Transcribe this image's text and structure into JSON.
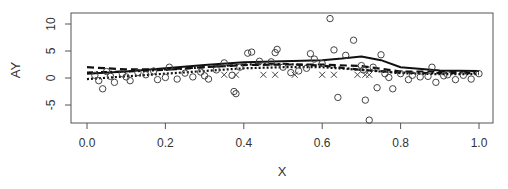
{
  "chart_data": {
    "type": "scatter",
    "title": "",
    "xlabel": "X",
    "ylabel": "AY",
    "xlim": [
      -0.04,
      1.04
    ],
    "ylim": [
      -8.5,
      12
    ],
    "xticks": [
      0.0,
      0.2,
      0.4,
      0.6,
      0.8,
      1.0
    ],
    "xtick_labels": [
      "0.0",
      "0.2",
      "0.4",
      "0.6",
      "0.8",
      "1.0"
    ],
    "yticks": [
      -5,
      0,
      5,
      10
    ],
    "ytick_labels": [
      "-5",
      "0",
      "5",
      "10"
    ],
    "grid": false,
    "legend": null,
    "series": [
      {
        "name": "observed (circles)",
        "marker": "circle",
        "points": [
          [
            0.02,
            0.5
          ],
          [
            0.03,
            -0.5
          ],
          [
            0.04,
            -2.0
          ],
          [
            0.05,
            1.2
          ],
          [
            0.06,
            0.3
          ],
          [
            0.07,
            -0.8
          ],
          [
            0.09,
            0.8
          ],
          [
            0.1,
            0.2
          ],
          [
            0.11,
            -0.5
          ],
          [
            0.13,
            1.0
          ],
          [
            0.15,
            0.6
          ],
          [
            0.17,
            1.3
          ],
          [
            0.18,
            -0.3
          ],
          [
            0.2,
            0.1
          ],
          [
            0.21,
            2.0
          ],
          [
            0.23,
            -0.2
          ],
          [
            0.25,
            0.9
          ],
          [
            0.27,
            0.2
          ],
          [
            0.29,
            1.1
          ],
          [
            0.3,
            0.4
          ],
          [
            0.31,
            -0.2
          ],
          [
            0.33,
            1.5
          ],
          [
            0.35,
            2.8
          ],
          [
            0.37,
            0.5
          ],
          [
            0.375,
            -2.5
          ],
          [
            0.38,
            -2.9
          ],
          [
            0.39,
            2.0
          ],
          [
            0.41,
            4.6
          ],
          [
            0.42,
            4.8
          ],
          [
            0.44,
            3.1
          ],
          [
            0.47,
            3.0
          ],
          [
            0.48,
            4.7
          ],
          [
            0.485,
            5.3
          ],
          [
            0.5,
            2.0
          ],
          [
            0.52,
            1.0
          ],
          [
            0.54,
            1.3
          ],
          [
            0.56,
            1.8
          ],
          [
            0.57,
            4.5
          ],
          [
            0.58,
            3.5
          ],
          [
            0.6,
            2.7
          ],
          [
            0.62,
            11.0
          ],
          [
            0.63,
            5.2
          ],
          [
            0.64,
            -3.6
          ],
          [
            0.66,
            4.2
          ],
          [
            0.68,
            7.0
          ],
          [
            0.7,
            2.3
          ],
          [
            0.705,
            1.5
          ],
          [
            0.71,
            -4.1
          ],
          [
            0.72,
            -7.8
          ],
          [
            0.73,
            2.0
          ],
          [
            0.74,
            -1.8
          ],
          [
            0.75,
            4.3
          ],
          [
            0.76,
            0.8
          ],
          [
            0.77,
            0.1
          ],
          [
            0.78,
            -2.0
          ],
          [
            0.8,
            0.8
          ],
          [
            0.82,
            -0.3
          ],
          [
            0.83,
            0.5
          ],
          [
            0.85,
            0.2
          ],
          [
            0.87,
            0.3
          ],
          [
            0.88,
            2.0
          ],
          [
            0.89,
            -0.8
          ],
          [
            0.91,
            0.4
          ],
          [
            0.92,
            0.6
          ],
          [
            0.94,
            -0.3
          ],
          [
            0.96,
            0.5
          ],
          [
            0.98,
            -0.2
          ],
          [
            1.0,
            0.8
          ]
        ]
      },
      {
        "name": "censored (crosses)",
        "marker": "x",
        "points": [
          [
            0.35,
            0.6
          ],
          [
            0.38,
            0.6
          ],
          [
            0.45,
            0.6
          ],
          [
            0.48,
            0.6
          ],
          [
            0.53,
            0.6
          ],
          [
            0.6,
            0.6
          ],
          [
            0.63,
            0.6
          ],
          [
            0.69,
            0.6
          ],
          [
            0.71,
            0.6
          ],
          [
            0.72,
            0.6
          ]
        ]
      },
      {
        "name": "fit solid",
        "style": "solid",
        "x": [
          0.0,
          0.1,
          0.2,
          0.3,
          0.4,
          0.5,
          0.6,
          0.65,
          0.7,
          0.75,
          0.8,
          0.9,
          1.0
        ],
        "values": [
          0.8,
          1.2,
          1.8,
          2.4,
          2.9,
          3.1,
          3.3,
          3.6,
          4.0,
          3.3,
          2.0,
          1.4,
          1.3
        ]
      },
      {
        "name": "fit dashed",
        "style": "dashed",
        "x": [
          0.0,
          0.1,
          0.2,
          0.3,
          0.4,
          0.5,
          0.6,
          0.7,
          0.8,
          0.9,
          1.0
        ],
        "values": [
          2.0,
          1.6,
          1.6,
          2.0,
          2.4,
          2.5,
          2.5,
          2.2,
          1.2,
          1.2,
          1.3
        ]
      },
      {
        "name": "fit dot-dash",
        "style": "dotdash",
        "x": [
          0.0,
          0.1,
          0.2,
          0.3,
          0.4,
          0.5,
          0.6,
          0.7,
          0.8,
          0.9,
          1.0
        ],
        "values": [
          1.0,
          1.2,
          1.5,
          2.0,
          2.5,
          2.6,
          2.3,
          1.5,
          1.0,
          0.9,
          0.9
        ]
      },
      {
        "name": "fit dotted",
        "style": "dotted",
        "x": [
          0.0,
          0.1,
          0.2,
          0.3,
          0.4,
          0.5,
          0.6,
          0.7,
          0.8,
          0.9,
          1.0
        ],
        "values": [
          -0.2,
          0.3,
          0.8,
          1.3,
          1.8,
          2.0,
          2.0,
          1.5,
          0.9,
          0.7,
          0.7
        ]
      }
    ]
  }
}
